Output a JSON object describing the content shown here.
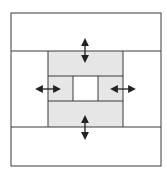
{
  "diagram": {
    "type": "nested-block-layout",
    "colors": {
      "background": "#ffffff",
      "stroke": "#3a3a3a",
      "fill_shaded": "#e6e6e6",
      "fill_center": "#ffffff",
      "arrow": "#222222"
    },
    "outer_frame": {
      "x": 11,
      "y": 13,
      "w": 150,
      "h": 153
    },
    "bands": {
      "top": {
        "y1": 13,
        "y2": 51
      },
      "bottom": {
        "y1": 127,
        "y2": 166
      },
      "left_column": {
        "x1": 11,
        "x2": 48
      },
      "right_column": {
        "x1": 123,
        "x2": 161
      }
    },
    "shaded_region": {
      "x": 48,
      "y": 51,
      "w": 75,
      "h": 76
    },
    "inner_lines": {
      "horizontal": [
        76,
        101
      ],
      "vertical": [
        73,
        98
      ]
    },
    "center_cell": {
      "x": 73,
      "y": 76,
      "w": 25,
      "h": 25
    },
    "arrows": [
      {
        "name": "top-arrow",
        "orientation": "vertical",
        "x": 85,
        "y1": 41,
        "y2": 60
      },
      {
        "name": "bottom-arrow",
        "orientation": "vertical",
        "x": 85,
        "y1": 118,
        "y2": 137
      },
      {
        "name": "left-arrow",
        "orientation": "horizontal",
        "y": 89,
        "x1": 38,
        "x2": 58
      },
      {
        "name": "right-arrow",
        "orientation": "horizontal",
        "y": 89,
        "x1": 113,
        "x2": 133
      }
    ]
  }
}
